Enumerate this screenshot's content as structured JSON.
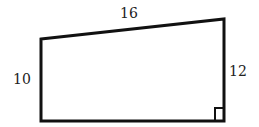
{
  "figure": {
    "shape": "right trapezoid",
    "labels": {
      "top": "16",
      "left": "10",
      "right": "12"
    },
    "right_angle_marker": "bottom-right",
    "stroke_color": "#111111"
  }
}
